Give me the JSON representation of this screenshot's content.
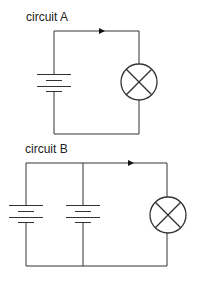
{
  "circuits": [
    {
      "label": "circuit A",
      "cells": 1,
      "components": [
        "cell",
        "lamp",
        "current-arrow"
      ]
    },
    {
      "label": "circuit B",
      "cells": 2,
      "cell_arrangement": "parallel",
      "components": [
        "cell",
        "cell",
        "lamp",
        "current-arrow"
      ]
    }
  ],
  "colors": {
    "line": "#333333",
    "background": "#ffffff"
  }
}
